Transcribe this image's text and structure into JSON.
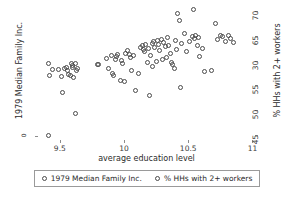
{
  "chart_data": {
    "type": "scatter",
    "title": "",
    "xlabel": "average education level",
    "ylabel_left": "1979 Median Family Inc.",
    "ylabel_right": "% HHs with 2+ workers",
    "xlim": [
      9.33,
      11.02
    ],
    "xticks": [
      "9.5",
      "10",
      "10.5",
      "11"
    ],
    "xtick_values": [
      9.5,
      10,
      10.5,
      11
    ],
    "right_ylim": [
      44.0,
      71.0
    ],
    "right_yticks": [
      "45",
      "50",
      "55",
      "30",
      "65",
      "70"
    ],
    "right_ytick_values": [
      45,
      50,
      55,
      60,
      65,
      70
    ],
    "left_yticks": [
      "0"
    ],
    "grid": false,
    "legend_position": "below-axes",
    "legend": [
      "1979 Median Family Inc.",
      "% HHs with 2+ workers"
    ],
    "marker": "open-circle",
    "marker_color": "#4a4a4a",
    "series": [
      {
        "name": "% HHs with 2+ workers",
        "x": [
          9.41,
          9.41,
          9.42,
          9.44,
          9.49,
          9.51,
          9.52,
          9.54,
          9.55,
          9.56,
          9.57,
          9.58,
          9.59,
          9.6,
          9.6,
          9.61,
          9.62,
          9.62,
          9.63,
          9.64,
          9.79,
          9.8,
          9.86,
          9.88,
          9.9,
          9.91,
          9.92,
          9.93,
          9.94,
          9.95,
          9.97,
          9.98,
          9.99,
          10.0,
          10.01,
          10.03,
          10.04,
          10.05,
          10.06,
          10.07,
          10.09,
          10.11,
          10.13,
          10.14,
          10.15,
          10.16,
          10.17,
          10.18,
          10.19,
          10.2,
          10.21,
          10.22,
          10.22,
          10.23,
          10.24,
          10.25,
          10.26,
          10.27,
          10.28,
          10.29,
          10.3,
          10.31,
          10.32,
          10.33,
          10.34,
          10.35,
          10.36,
          10.37,
          10.38,
          10.39,
          10.4,
          10.41,
          10.42,
          10.43,
          10.44,
          10.45,
          10.47,
          10.49,
          10.51,
          10.53,
          10.54,
          10.55,
          10.56,
          10.57,
          10.58,
          10.59,
          10.61,
          10.63,
          10.68,
          10.71,
          10.73,
          10.75,
          10.77,
          10.79,
          10.81,
          10.83,
          10.85
        ],
        "y": [
          59.5,
          44.9,
          57.0,
          58.2,
          58.2,
          56.8,
          53.5,
          58.5,
          58.6,
          58.1,
          57.2,
          56.9,
          59.4,
          58.6,
          59.0,
          56.6,
          49.3,
          59.5,
          58.0,
          58.4,
          59.2,
          59.3,
          60.5,
          58.5,
          61.0,
          57.5,
          57.0,
          60.3,
          60.8,
          61.2,
          56.0,
          60.0,
          59.4,
          55.8,
          61.5,
          62.0,
          61.3,
          60.7,
          58.0,
          61.0,
          54.0,
          57.4,
          62.7,
          63.0,
          62.2,
          61.8,
          63.3,
          59.7,
          62.4,
          52.9,
          61.0,
          63.5,
          58.8,
          63.8,
          62.6,
          59.9,
          64.0,
          63.2,
          62.1,
          64.3,
          60.2,
          63.6,
          62.8,
          60.6,
          64.6,
          63.0,
          61.4,
          59.6,
          59.2,
          58.5,
          64.1,
          62.3,
          69.5,
          68.0,
          54.5,
          63.4,
          65.5,
          61.9,
          63.8,
          64.9,
          70.2,
          64.5,
          65.0,
          63.1,
          64.7,
          60.9,
          62.5,
          57.8,
          58.0,
          67.5,
          64.2,
          65.1,
          64.8,
          63.9,
          65.0,
          64.4,
          63.6
        ]
      }
    ]
  }
}
